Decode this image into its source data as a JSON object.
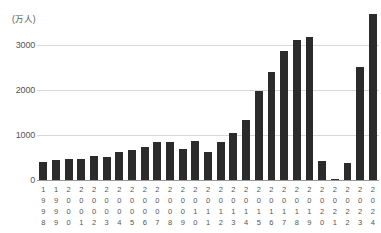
{
  "chart_data": {
    "type": "bar",
    "title": "",
    "subtitle": "",
    "xlabel": "",
    "ylabel": "",
    "unit_label": "(万人)",
    "ylim": [
      0,
      4000
    ],
    "grid": true,
    "grid_axis": "y",
    "legend": false,
    "bar_color": "#2b2b2b",
    "grid_color": "#d8d8d8",
    "axis_color": "#9a9a9a",
    "yticks": [
      {
        "value": 3000,
        "label": "3000"
      },
      {
        "value": 2000,
        "label": "2000"
      },
      {
        "value": 1000,
        "label": "1000"
      },
      {
        "value": 0,
        "label": "0"
      }
    ],
    "categories": [
      "1998",
      "1999",
      "2000",
      "2001",
      "2002",
      "2003",
      "2004",
      "2005",
      "2006",
      "2007",
      "2008",
      "2009",
      "2010",
      "2011",
      "2012",
      "2013",
      "2014",
      "2015",
      "2016",
      "2017",
      "2018",
      "2019",
      "2020",
      "2021",
      "2022",
      "2023",
      "2024"
    ],
    "values": [
      411,
      444,
      476,
      477,
      524,
      521,
      614,
      673,
      733,
      835,
      835,
      679,
      861,
      622,
      836,
      1036,
      1341,
      1974,
      2404,
      2869,
      3119,
      3188,
      412,
      25,
      383,
      2507,
      3687
    ],
    "series": [
      {
        "name": "訪日外国人数",
        "values": [
          411,
          444,
          476,
          477,
          524,
          521,
          614,
          673,
          733,
          835,
          835,
          679,
          861,
          622,
          836,
          1036,
          1341,
          1974,
          2404,
          2869,
          3119,
          3188,
          412,
          25,
          383,
          2507,
          3687
        ]
      }
    ]
  }
}
